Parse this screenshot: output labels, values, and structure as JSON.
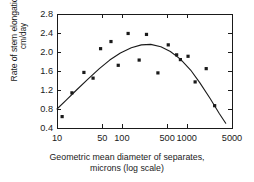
{
  "figure": {
    "background": "#ffffff",
    "ink": "#1a1a1a"
  },
  "axes": {
    "frame": {
      "left": 57,
      "top": 14,
      "right": 232,
      "bottom": 128
    },
    "y": {
      "label_line1": "Rate of stem elongation,",
      "label_line2": "cm/day",
      "ticks": [
        "2.8",
        "2.4",
        "2.0",
        "1.6",
        "1.2",
        "0.8",
        "0.4"
      ],
      "min": 0.4,
      "max": 2.8
    },
    "x": {
      "label_line1": "Geometric mean diameter of separates,",
      "label_line2": "microns (log scale)",
      "ticks": [
        "10",
        "50",
        "100",
        "500",
        "1000",
        "5000"
      ],
      "tick_values": [
        10,
        50,
        100,
        500,
        1000,
        5000
      ],
      "min": 10,
      "max": 5000,
      "scale": "log"
    }
  },
  "footer_ghost": "",
  "chart_data": {
    "type": "scatter",
    "title": "",
    "subtitle": "",
    "xlabel": "Geometric mean diameter of separates, microns (log scale)",
    "ylabel": "Rate of stem elongation, cm/day",
    "xscale": "log",
    "xlim": [
      10,
      5000
    ],
    "ylim": [
      0.4,
      2.8
    ],
    "xticks": [
      10,
      50,
      100,
      500,
      1000,
      5000
    ],
    "yticks": [
      0.4,
      0.8,
      1.2,
      1.6,
      2.0,
      2.4,
      2.8
    ],
    "grid": false,
    "legend": "none",
    "marker": "filled-square",
    "marker_color": "#1a1a1a",
    "series": [
      {
        "name": "Observed stem elongation rate",
        "type": "scatter",
        "points": [
          {
            "x": 12,
            "y": 0.64
          },
          {
            "x": 17,
            "y": 1.14
          },
          {
            "x": 26,
            "y": 1.57
          },
          {
            "x": 36,
            "y": 1.45
          },
          {
            "x": 47,
            "y": 2.07
          },
          {
            "x": 68,
            "y": 2.22
          },
          {
            "x": 88,
            "y": 1.72
          },
          {
            "x": 125,
            "y": 2.39
          },
          {
            "x": 185,
            "y": 1.83
          },
          {
            "x": 240,
            "y": 2.37
          },
          {
            "x": 360,
            "y": 1.56
          },
          {
            "x": 520,
            "y": 2.15
          },
          {
            "x": 700,
            "y": 1.94
          },
          {
            "x": 800,
            "y": 1.84
          },
          {
            "x": 1050,
            "y": 1.91
          },
          {
            "x": 1350,
            "y": 1.37
          },
          {
            "x": 2000,
            "y": 1.65
          },
          {
            "x": 2700,
            "y": 0.87
          }
        ]
      },
      {
        "name": "Fitted quadratic trend (log x)",
        "type": "line",
        "color": "#1a1a1a",
        "curve_points": [
          {
            "x": 10,
            "y": 0.8
          },
          {
            "x": 14,
            "y": 0.99
          },
          {
            "x": 20,
            "y": 1.2
          },
          {
            "x": 30,
            "y": 1.43
          },
          {
            "x": 45,
            "y": 1.65
          },
          {
            "x": 65,
            "y": 1.83
          },
          {
            "x": 95,
            "y": 1.98
          },
          {
            "x": 140,
            "y": 2.09
          },
          {
            "x": 200,
            "y": 2.15
          },
          {
            "x": 280,
            "y": 2.16
          },
          {
            "x": 400,
            "y": 2.11
          },
          {
            "x": 560,
            "y": 2.01
          },
          {
            "x": 800,
            "y": 1.85
          },
          {
            "x": 1150,
            "y": 1.62
          },
          {
            "x": 1600,
            "y": 1.35
          },
          {
            "x": 2300,
            "y": 1.02
          },
          {
            "x": 3200,
            "y": 0.7
          },
          {
            "x": 4000,
            "y": 0.5
          }
        ]
      }
    ]
  }
}
